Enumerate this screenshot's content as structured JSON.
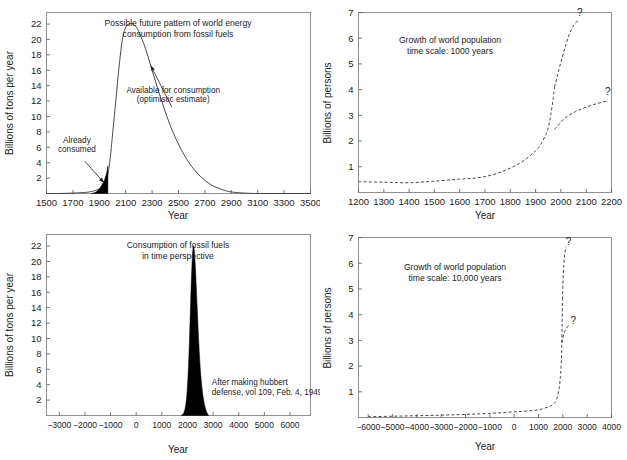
{
  "figure": {
    "background": "#ffffff",
    "line_color": "#333333",
    "fill_color": "#000000",
    "frame_color": "#888888"
  },
  "chart_data": [
    {
      "id": "fossil-fuel-future",
      "type": "line",
      "title": "Possible future pattern of world energy\nconsumption from fossil fuels",
      "title_line1": "Possible future pattern of world energy",
      "title_line2": "consumption from fossil fuels",
      "xlabel": "Year",
      "ylabel": "Billions of tons per year",
      "xlim": [
        1500,
        3500
      ],
      "ylim": [
        0,
        23.5
      ],
      "xticks": [
        1500,
        1700,
        1900,
        2100,
        2300,
        2500,
        2700,
        2900,
        3100,
        3300,
        3500
      ],
      "yticks": [
        2,
        4,
        6,
        8,
        10,
        12,
        14,
        16,
        18,
        20,
        22
      ],
      "grid": false,
      "legend": "none",
      "series": [
        {
          "name": "Available for consumption (optimistic estimate)",
          "style": "solid",
          "x": [
            1500,
            1600,
            1700,
            1800,
            1850,
            1900,
            1925,
            1950,
            1960,
            1970,
            1980,
            1990,
            2000,
            2025,
            2050,
            2075,
            2100,
            2125,
            2150,
            2175,
            2200,
            2250,
            2300,
            2350,
            2400,
            2450,
            2500,
            2550,
            2600,
            2650,
            2700,
            2750,
            2800,
            2850,
            2900,
            3000,
            3100,
            3300,
            3500
          ],
          "y": [
            0.0,
            0.0,
            0.05,
            0.15,
            0.3,
            0.6,
            1.0,
            1.6,
            2.2,
            3.0,
            4.2,
            5.8,
            7.6,
            12.0,
            16.5,
            20.0,
            21.6,
            22.0,
            22.05,
            21.7,
            21.0,
            18.8,
            16.0,
            13.2,
            10.6,
            8.3,
            6.4,
            4.8,
            3.5,
            2.5,
            1.7,
            1.1,
            0.7,
            0.4,
            0.2,
            0.05,
            0.0,
            0.0,
            0.0
          ]
        },
        {
          "name": "Already consumed",
          "style": "filled",
          "x": [
            1840,
            1870,
            1900,
            1920,
            1940,
            1950,
            1960,
            1965,
            1965
          ],
          "y": [
            0.0,
            0.15,
            0.6,
            1.1,
            1.8,
            2.3,
            3.0,
            3.4,
            0.0
          ]
        }
      ],
      "annotations": [
        {
          "name": "already-consumed",
          "line1": "Already",
          "line2": "consumed",
          "text_x": 1730,
          "text_y": 6.6,
          "arrow_from_x": 1790,
          "arrow_from_y": 4.2,
          "arrow_to_x": 1935,
          "arrow_to_y": 1.4
        },
        {
          "name": "available-for-consumption",
          "line1": "Available for consumption",
          "line2": "(optimistic estimate)",
          "text_x": 2460,
          "text_y": 13.0,
          "arrow_from_x": 2450,
          "arrow_from_y": 11.2,
          "arrow_to_x": 2290,
          "arrow_to_y": 16.6
        }
      ]
    },
    {
      "id": "world-population-1000",
      "type": "line",
      "title_line1": "Growth of world population",
      "title_line2": "time scale: 1000 years",
      "xlabel": "Year",
      "ylabel": "Billions of persons",
      "xlim": [
        1200,
        2200
      ],
      "ylim": [
        0,
        7
      ],
      "xticks": [
        1200,
        1300,
        1400,
        1500,
        1600,
        1700,
        1800,
        1900,
        2000,
        2100,
        2200
      ],
      "yticks": [
        1,
        2,
        3,
        4,
        5,
        6,
        7
      ],
      "grid": false,
      "legend": "none",
      "series": [
        {
          "name": "historical",
          "style": "dashed",
          "x": [
            1200,
            1300,
            1400,
            1500,
            1600,
            1650,
            1700,
            1750,
            1800,
            1850,
            1900,
            1920,
            1940,
            1950,
            1960,
            1970,
            1975
          ],
          "y": [
            0.42,
            0.4,
            0.38,
            0.44,
            0.52,
            0.55,
            0.62,
            0.75,
            0.95,
            1.22,
            1.62,
            1.86,
            2.25,
            2.52,
            3.02,
            3.7,
            4.1
          ]
        },
        {
          "name": "projection-high",
          "style": "dashed",
          "x": [
            1975,
            1990,
            2005,
            2020,
            2035,
            2050,
            2060,
            2070
          ],
          "y": [
            4.1,
            4.7,
            5.25,
            5.75,
            6.2,
            6.5,
            6.62,
            6.68
          ]
        },
        {
          "name": "projection-low",
          "style": "dashed",
          "x": [
            1975,
            1990,
            2010,
            2040,
            2070,
            2100,
            2140,
            2180
          ],
          "y": [
            2.45,
            2.62,
            2.85,
            3.05,
            3.2,
            3.32,
            3.45,
            3.55
          ]
        }
      ],
      "annotations": [
        {
          "name": "question-mark-high",
          "text": "?",
          "x": 2075,
          "y": 6.85
        },
        {
          "name": "question-mark-low",
          "text": "?",
          "x": 2185,
          "y": 3.78
        }
      ]
    },
    {
      "id": "fossil-fuel-perspective",
      "type": "area",
      "title_line1": "Consumption of fossil fuels",
      "title_line2": "in time perspective",
      "xlabel": "Year",
      "ylabel": "Billions of tons per year",
      "xlim": [
        -3500,
        6800
      ],
      "ylim": [
        0,
        23.5
      ],
      "xticks": [
        -3000,
        -2000,
        -1000,
        0,
        1000,
        2000,
        3000,
        4000,
        5000,
        6000
      ],
      "xticklabels": [
        "−3000",
        "−2000",
        "−1000",
        "0",
        "1000",
        "2000",
        "3000",
        "4000",
        "5000",
        "6000"
      ],
      "yticks": [
        2,
        4,
        6,
        8,
        10,
        12,
        14,
        16,
        18,
        20,
        22
      ],
      "grid": false,
      "legend": "none",
      "series": [
        {
          "name": "fossil fuel spike",
          "style": "filled",
          "x": [
            1750,
            1850,
            1930,
            1990,
            2040,
            2090,
            2140,
            2190,
            2230,
            2270,
            2320,
            2380,
            2440,
            2520,
            2620,
            2720,
            2820
          ],
          "y": [
            0.0,
            0.3,
            1.3,
            3.3,
            6.5,
            11.0,
            16.5,
            20.5,
            22.0,
            21.3,
            18.5,
            14.0,
            9.5,
            5.2,
            2.2,
            0.7,
            0.0
          ]
        }
      ],
      "annotations": [
        {
          "name": "source-note",
          "line1": "After making hubbert",
          "line2": "defense, vol 109, Feb. 4, 1949",
          "text_x": 2950,
          "text_y": 4.0
        }
      ]
    },
    {
      "id": "world-population-10000",
      "type": "line",
      "title_line1": "Growth of world population",
      "title_line2": "time scale: 10,000 years",
      "xlabel": "Year",
      "ylabel": "Billions of persons",
      "xlim": [
        -6400,
        4000
      ],
      "ylim": [
        0,
        7
      ],
      "xticks": [
        -6000,
        -5000,
        -4000,
        -3000,
        -2000,
        -1000,
        0,
        1000,
        2000,
        3000,
        4000
      ],
      "xticklabels": [
        "−6000",
        "−5000",
        "−4000",
        "−3000",
        "−2000",
        "−1000",
        "0",
        "1000",
        "2000",
        "3000",
        "4000"
      ],
      "yticks": [
        1,
        2,
        3,
        4,
        5,
        6,
        7
      ],
      "grid": false,
      "legend": "none",
      "series": [
        {
          "name": "historical",
          "style": "dashed",
          "x": [
            -6000,
            -5000,
            -4000,
            -3000,
            -2000,
            -1000,
            0,
            500,
            1000,
            1300,
            1500,
            1650,
            1750,
            1850,
            1900,
            1930,
            1950,
            1970,
            1985
          ],
          "y": [
            0.03,
            0.05,
            0.07,
            0.09,
            0.12,
            0.16,
            0.22,
            0.25,
            0.3,
            0.38,
            0.45,
            0.55,
            0.72,
            1.15,
            1.6,
            2.0,
            2.5,
            3.6,
            4.6
          ]
        },
        {
          "name": "projection-high",
          "style": "dashed",
          "x": [
            1985,
            2020,
            2060,
            2100,
            2140
          ],
          "y": [
            4.6,
            5.6,
            6.2,
            6.5,
            6.65
          ]
        },
        {
          "name": "projection-low",
          "style": "dashed",
          "x": [
            1960,
            2000,
            2060,
            2130,
            2210,
            2300
          ],
          "y": [
            2.9,
            3.1,
            3.3,
            3.45,
            3.55,
            3.6
          ]
        }
      ],
      "annotations": [
        {
          "name": "question-mark-high",
          "text": "?",
          "x": 2230,
          "y": 6.7
        },
        {
          "name": "question-mark-low",
          "text": "?",
          "x": 2430,
          "y": 3.62
        }
      ]
    }
  ]
}
